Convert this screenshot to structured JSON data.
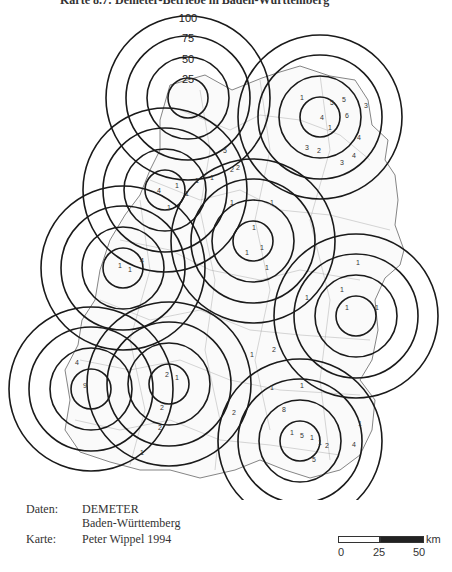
{
  "title": "Karte 8.7: Demeter-Betriebe in Baden-Württemberg",
  "ring_labels": [
    "100",
    "75",
    "50",
    "25"
  ],
  "ring_radii_px": [
    20,
    41,
    62,
    82
  ],
  "circle_centers": [
    {
      "name": "north",
      "x": 188,
      "y": 98
    },
    {
      "name": "northeast",
      "x": 320,
      "y": 117
    },
    {
      "name": "northwest-inner",
      "x": 165,
      "y": 190
    },
    {
      "name": "center",
      "x": 253,
      "y": 241
    },
    {
      "name": "west",
      "x": 123,
      "y": 268
    },
    {
      "name": "east",
      "x": 356,
      "y": 316
    },
    {
      "name": "southwest",
      "x": 91,
      "y": 389
    },
    {
      "name": "south-west-center",
      "x": 169,
      "y": 384
    },
    {
      "name": "south",
      "x": 300,
      "y": 441
    }
  ],
  "farm_counts": [
    {
      "x": 330,
      "y": 105,
      "v": "5"
    },
    {
      "x": 345,
      "y": 118,
      "v": "6"
    },
    {
      "x": 320,
      "y": 120,
      "v": "4"
    },
    {
      "x": 328,
      "y": 130,
      "v": "1"
    },
    {
      "x": 300,
      "y": 100,
      "v": "1"
    },
    {
      "x": 305,
      "y": 150,
      "v": "3"
    },
    {
      "x": 317,
      "y": 153,
      "v": "2"
    },
    {
      "x": 340,
      "y": 165,
      "v": "3"
    },
    {
      "x": 352,
      "y": 158,
      "v": "4"
    },
    {
      "x": 357,
      "y": 140,
      "v": "4"
    },
    {
      "x": 364,
      "y": 108,
      "v": "3"
    },
    {
      "x": 342,
      "y": 102,
      "v": "5"
    },
    {
      "x": 223,
      "y": 153,
      "v": "5"
    },
    {
      "x": 230,
      "y": 172,
      "v": "2"
    },
    {
      "x": 236,
      "y": 170,
      "v": "2"
    },
    {
      "x": 210,
      "y": 180,
      "v": "1"
    },
    {
      "x": 195,
      "y": 183,
      "v": "1"
    },
    {
      "x": 175,
      "y": 188,
      "v": "1"
    },
    {
      "x": 185,
      "y": 196,
      "v": "1"
    },
    {
      "x": 157,
      "y": 193,
      "v": "4"
    },
    {
      "x": 167,
      "y": 210,
      "v": "1"
    },
    {
      "x": 252,
      "y": 230,
      "v": "1"
    },
    {
      "x": 260,
      "y": 250,
      "v": "1"
    },
    {
      "x": 245,
      "y": 255,
      "v": "1"
    },
    {
      "x": 265,
      "y": 270,
      "v": "1"
    },
    {
      "x": 230,
      "y": 205,
      "v": "1"
    },
    {
      "x": 270,
      "y": 205,
      "v": "1"
    },
    {
      "x": 118,
      "y": 268,
      "v": "1"
    },
    {
      "x": 128,
      "y": 272,
      "v": "1"
    },
    {
      "x": 140,
      "y": 263,
      "v": "4"
    },
    {
      "x": 345,
      "y": 310,
      "v": "1"
    },
    {
      "x": 340,
      "y": 292,
      "v": "1"
    },
    {
      "x": 375,
      "y": 310,
      "v": "1"
    },
    {
      "x": 356,
      "y": 265,
      "v": "1"
    },
    {
      "x": 305,
      "y": 300,
      "v": "1"
    },
    {
      "x": 83,
      "y": 388,
      "v": "9"
    },
    {
      "x": 75,
      "y": 365,
      "v": "4"
    },
    {
      "x": 165,
      "y": 377,
      "v": "2"
    },
    {
      "x": 175,
      "y": 380,
      "v": "1"
    },
    {
      "x": 160,
      "y": 410,
      "v": "2"
    },
    {
      "x": 158,
      "y": 430,
      "v": "2"
    },
    {
      "x": 140,
      "y": 455,
      "v": "1"
    },
    {
      "x": 290,
      "y": 435,
      "v": "1"
    },
    {
      "x": 300,
      "y": 438,
      "v": "5"
    },
    {
      "x": 310,
      "y": 440,
      "v": "1"
    },
    {
      "x": 318,
      "y": 445,
      "v": "1"
    },
    {
      "x": 325,
      "y": 448,
      "v": "2"
    },
    {
      "x": 312,
      "y": 462,
      "v": "5"
    },
    {
      "x": 352,
      "y": 447,
      "v": "4"
    },
    {
      "x": 358,
      "y": 426,
      "v": "1"
    },
    {
      "x": 282,
      "y": 412,
      "v": "8"
    },
    {
      "x": 270,
      "y": 390,
      "v": "1"
    },
    {
      "x": 300,
      "y": 388,
      "v": "1"
    },
    {
      "x": 232,
      "y": 415,
      "v": "2"
    },
    {
      "x": 250,
      "y": 357,
      "v": "1"
    },
    {
      "x": 272,
      "y": 352,
      "v": "2"
    }
  ],
  "legend": {
    "daten_label": "Daten:",
    "daten_value_line1": "DEMETER",
    "daten_value_line2": "Baden-Württemberg",
    "karte_label": "Karte:",
    "karte_value": "Peter Wippel 1994"
  },
  "scale_bar": {
    "unit": "km",
    "ticks": [
      "0",
      "25",
      "50"
    ]
  },
  "colors": {
    "ring": "#1a1a1a",
    "outline": "#555555",
    "background": "#ffffff"
  }
}
